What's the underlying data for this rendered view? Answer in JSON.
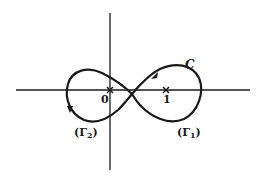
{
  "diagram": {
    "type": "contour figure-eight in complex plane",
    "colors": {
      "stroke": "#1a1a1a",
      "background": "#ffffff"
    },
    "axes": {
      "horizontal": {
        "y": 90,
        "x_from": 16,
        "x_to": 250
      },
      "vertical": {
        "x": 110,
        "y_from": 13,
        "y_to": 170
      }
    },
    "points": [
      {
        "id": "origin",
        "label": "0",
        "marker": "cross",
        "x": 110,
        "y": 90
      },
      {
        "id": "one",
        "label": "1",
        "marker": "cross",
        "x": 166,
        "y": 90
      }
    ],
    "curve": {
      "label": "C",
      "shape": "figure-eight",
      "crossing": {
        "x": 132,
        "y": 94
      },
      "arrows": [
        {
          "position": "upper-left of right lobe",
          "direction": "down-left"
        },
        {
          "position": "lower-left of left lobe",
          "direction": "down"
        }
      ]
    },
    "loop_labels": {
      "gamma2": {
        "text": "(Γ",
        "sub": "2",
        "close": ")"
      },
      "gamma1": {
        "text": "(Γ",
        "sub": "1",
        "close": ")"
      }
    }
  }
}
